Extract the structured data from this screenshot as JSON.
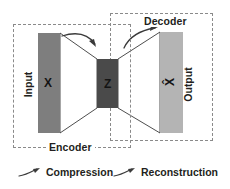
{
  "diagram": {
    "background_color": "#ffffff",
    "groups": [
      {
        "id": "encoder",
        "label": "Encoder",
        "border_color": "#8a8a8a",
        "border_style": "dashed"
      },
      {
        "id": "decoder",
        "label": "Decoder",
        "border_color": "#8a8a8a",
        "border_style": "dashed"
      }
    ],
    "blocks": [
      {
        "id": "input",
        "side_label": "Input",
        "value": "X",
        "fill_color": "#7e7e7e"
      },
      {
        "id": "latent",
        "side_label": "",
        "value": "Z",
        "fill_color": "#4a4a4a"
      },
      {
        "id": "output",
        "side_label": "Output",
        "value": "X̂",
        "fill_color": "#b4b4b4"
      }
    ],
    "legend": [
      {
        "id": "compression",
        "label": "Compression",
        "icon": "curved-arrow-icon"
      },
      {
        "id": "reconstruction",
        "label": "Reconstruction",
        "icon": "curved-arrow-icon"
      }
    ],
    "connectors": {
      "encoder_funnel": "input-block narrows to latent-block",
      "decoder_funnel": "latent-block widens to output-block",
      "compression_arrow": "curved arrow above encoder funnel",
      "reconstruction_arrow": "curved arrow above decoder funnel"
    }
  }
}
